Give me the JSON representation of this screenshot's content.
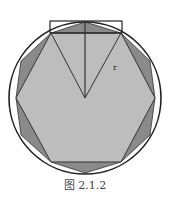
{
  "figure": {
    "caption": "图 2.1.2",
    "radius_label": "r",
    "colors": {
      "hexagon_fill": "#bdbdbd",
      "dodecagon_fill": "#8a8a8a",
      "stroke": "#222222",
      "background": "#ffffff"
    },
    "circle": {
      "cx": 85,
      "cy": 98,
      "r": 75
    },
    "hexagon_points": "51,33 121,33 155,98 121,162 51,162 16,98",
    "dodecagon_points": "51,33 85,22 121,33 150,61 155,98 150,135 121,162 85,173 51,162 21,135 16,98 21,61",
    "rectangle": {
      "x": 50,
      "y": 21,
      "w": 72,
      "h": 12
    }
  }
}
